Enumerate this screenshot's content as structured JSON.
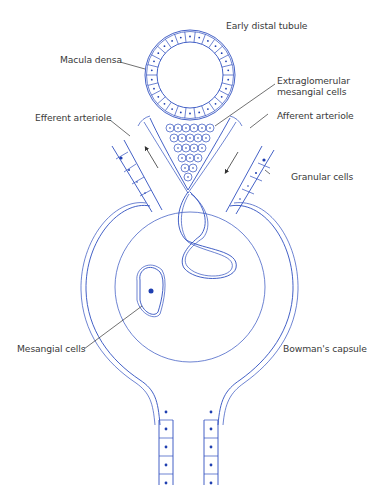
{
  "diagram": {
    "colors": {
      "structure": "#2f4fbf",
      "nucleus": "#1f3fb0",
      "leader": "#333333",
      "label_text": "#3a3a3a",
      "background": "#ffffff"
    },
    "labels": {
      "early_distal_tubule": "Early distal tubule",
      "macula_densa": "Macula densa",
      "extraglomerular_line1": "Extraglomerular",
      "extraglomerular_line2": "mesangial cells",
      "efferent_arteriole": "Efferent arteriole",
      "afferent_arteriole": "Afferent arteriole",
      "granular_cells": "Granular cells",
      "mesangial_cells": "Mesangial cells",
      "bowmans_capsule": "Bowman's capsule"
    }
  }
}
